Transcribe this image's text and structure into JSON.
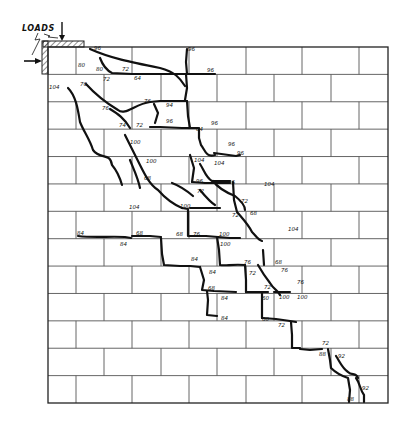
{
  "figure": {
    "type": "masonry crack pattern diagram",
    "load_label": "LOADS",
    "wall": {
      "x0": 48,
      "y0": 47,
      "x1": 388,
      "y1": 403,
      "rows": 13,
      "brick_width": 56.7,
      "odd_row_joints": [
        76,
        132,
        189,
        246,
        302,
        359
      ],
      "even_row_joints": [
        104,
        161,
        217,
        274,
        331
      ]
    },
    "colors": {
      "line": "#555555",
      "crack": "#111111",
      "background": "#ffffff"
    },
    "cracks": [
      "M90,49 C110,58 130,62 160,68 C175,72 180,78 185,86",
      "M187,49 L186,62 L187,74",
      "M100,58 C103,66 106,70 112,73 L132,74 L185,74 L215,74",
      "M186,74 L187,88 L185,100",
      "M68,88 C76,96 78,110 80,122 C84,132 90,140 93,150 C100,160 110,152 112,165 C118,172 120,178 122,185",
      "M86,84 C95,94 108,104 118,110 C125,116 135,104 150,102 L160,101 L187,101",
      "M110,109 C118,114 124,118 130,128",
      "M187,101 L188,116 L190,128",
      "M154,104 L158,113 L155,123",
      "M150,127 L160,127 L182,128 L198,128",
      "M199,128 L199,138 L201,145 C205,150 206,158 215,155",
      "M214,153 L236,156 L240,155",
      "M125,135 C130,145 135,155 140,165 C145,175 150,185 158,190 C165,198 175,205 182,208",
      "M130,160 C134,170 138,178 140,188",
      "M200,164 C204,170 206,178 212,181 L230,181",
      "M190,155 L194,168 L192,182",
      "M192,182 L205,183 L230,183",
      "M213,181 C218,188 225,192 235,196 C240,200 245,205 245,210",
      "M172,183 C180,186 186,190 193,196",
      "M233,182 L234,200 L237,212 C242,218 248,224 252,232 C256,236 258,240 262,241",
      "M190,208 L204,208 L220,208",
      "M200,190 C205,196 210,202 215,205",
      "M182,208 L188,209 L188,222 L188,236",
      "M189,236 L206,236 L230,238 L240,238",
      "M78,236 C95,238 110,236 125,237 L131,238",
      "M132,236 L150,236 L161,237",
      "M161,238 L162,254 L164,265 L180,266",
      "M180,266 L190,266 L200,267",
      "M200,267 L204,280 L202,290 L214,291 L236,292",
      "M217,237 L219,250 L220,265 C226,266 232,264 245,265",
      "M245,265 L246,280 L246,292",
      "M207,291 L208,300 L207,315 L217,316",
      "M246,292 L258,292 L268,292",
      "M258,265 C262,272 266,278 270,283 C274,290 278,290 280,295",
      "M263,250 L264,265",
      "M274,292 L278,292 L290,292",
      "M262,292 L262,306 L262,318",
      "M262,318 L276,319 L290,321 L296,322",
      "M291,322 L292,335 L292,348 L300,348",
      "M300,349 L310,350 L322,349",
      "M328,349 L330,360 L331,368 C335,372 342,376 348,378 L350,390 L349,402",
      "M336,356 C340,362 342,368 348,372 C352,376 356,372 358,378",
      "M356,378 C360,383 360,390 364,395 L364,402"
    ],
    "labels": [
      {
        "x": 94,
        "y": 50,
        "t": "96"
      },
      {
        "x": 78,
        "y": 67,
        "t": "80"
      },
      {
        "x": 96,
        "y": 71,
        "t": "80"
      },
      {
        "x": 122,
        "y": 71,
        "t": "72"
      },
      {
        "x": 103,
        "y": 81,
        "t": "72"
      },
      {
        "x": 134,
        "y": 80,
        "t": "64"
      },
      {
        "x": 188,
        "y": 51,
        "t": "96"
      },
      {
        "x": 207,
        "y": 72,
        "t": "96"
      },
      {
        "x": 49,
        "y": 89,
        "t": "104"
      },
      {
        "x": 80,
        "y": 86,
        "t": "76"
      },
      {
        "x": 102,
        "y": 110,
        "t": "76"
      },
      {
        "x": 119,
        "y": 127,
        "t": "74"
      },
      {
        "x": 136,
        "y": 127,
        "t": "72"
      },
      {
        "x": 144,
        "y": 103,
        "t": "76"
      },
      {
        "x": 166,
        "y": 107,
        "t": "94"
      },
      {
        "x": 166,
        "y": 123,
        "t": "96"
      },
      {
        "x": 196,
        "y": 131,
        "t": "64"
      },
      {
        "x": 211,
        "y": 125,
        "t": "96"
      },
      {
        "x": 228,
        "y": 146,
        "t": "96"
      },
      {
        "x": 237,
        "y": 155,
        "t": "96"
      },
      {
        "x": 130,
        "y": 144,
        "t": "100"
      },
      {
        "x": 146,
        "y": 163,
        "t": "100"
      },
      {
        "x": 144,
        "y": 180,
        "t": "68"
      },
      {
        "x": 129,
        "y": 209,
        "t": "104"
      },
      {
        "x": 180,
        "y": 208,
        "t": "100"
      },
      {
        "x": 194,
        "y": 162,
        "t": "104"
      },
      {
        "x": 196,
        "y": 183,
        "t": "96"
      },
      {
        "x": 214,
        "y": 165,
        "t": "104"
      },
      {
        "x": 228,
        "y": 184,
        "t": "96"
      },
      {
        "x": 264,
        "y": 186,
        "t": "104"
      },
      {
        "x": 197,
        "y": 193,
        "t": "72"
      },
      {
        "x": 241,
        "y": 203,
        "t": "72"
      },
      {
        "x": 232,
        "y": 217,
        "t": "72"
      },
      {
        "x": 250,
        "y": 215,
        "t": "68"
      },
      {
        "x": 288,
        "y": 231,
        "t": "104"
      },
      {
        "x": 77,
        "y": 235,
        "t": "84"
      },
      {
        "x": 120,
        "y": 246,
        "t": "84"
      },
      {
        "x": 136,
        "y": 235,
        "t": "68"
      },
      {
        "x": 176,
        "y": 236,
        "t": "68"
      },
      {
        "x": 193,
        "y": 236,
        "t": "76"
      },
      {
        "x": 219,
        "y": 236,
        "t": "100"
      },
      {
        "x": 220,
        "y": 246,
        "t": "100"
      },
      {
        "x": 191,
        "y": 261,
        "t": "84"
      },
      {
        "x": 209,
        "y": 274,
        "t": "84"
      },
      {
        "x": 244,
        "y": 264,
        "t": "76"
      },
      {
        "x": 249,
        "y": 275,
        "t": "72"
      },
      {
        "x": 275,
        "y": 264,
        "t": "68"
      },
      {
        "x": 281,
        "y": 272,
        "t": "76"
      },
      {
        "x": 297,
        "y": 284,
        "t": "76"
      },
      {
        "x": 208,
        "y": 290,
        "t": "68"
      },
      {
        "x": 221,
        "y": 300,
        "t": "84"
      },
      {
        "x": 264,
        "y": 289,
        "t": "72"
      },
      {
        "x": 262,
        "y": 300,
        "t": "60"
      },
      {
        "x": 279,
        "y": 299,
        "t": "100"
      },
      {
        "x": 297,
        "y": 299,
        "t": "100"
      },
      {
        "x": 221,
        "y": 320,
        "t": "84"
      },
      {
        "x": 262,
        "y": 321,
        "t": "60"
      },
      {
        "x": 278,
        "y": 327,
        "t": "72"
      },
      {
        "x": 322,
        "y": 345,
        "t": "72"
      },
      {
        "x": 319,
        "y": 356,
        "t": "88"
      },
      {
        "x": 338,
        "y": 358,
        "t": "92"
      },
      {
        "x": 362,
        "y": 390,
        "t": "92"
      },
      {
        "x": 347,
        "y": 401,
        "t": "88"
      }
    ]
  }
}
